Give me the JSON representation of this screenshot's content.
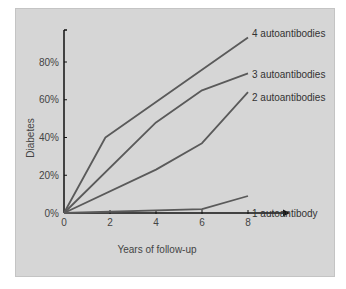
{
  "chart_data": {
    "type": "line",
    "title": "",
    "xlabel": "Years of follow-up",
    "ylabel": "Diabetes",
    "xlim": [
      0,
      8
    ],
    "ylim": [
      0,
      95
    ],
    "x_ticks": [
      "0",
      "2",
      "4",
      "6",
      "8"
    ],
    "y_ticks": [
      "0%",
      "20%",
      "40%",
      "60%",
      "80%"
    ],
    "grid": false,
    "legend_position": "inline-right",
    "series": [
      {
        "name": "4 autoantibodies",
        "points": [
          [
            0,
            0
          ],
          [
            1.8,
            40
          ],
          [
            8,
            93
          ]
        ]
      },
      {
        "name": "3 autoantibodies",
        "points": [
          [
            0,
            0
          ],
          [
            4,
            48
          ],
          [
            6,
            65
          ],
          [
            8,
            74
          ]
        ]
      },
      {
        "name": "2 autoantibodies",
        "points": [
          [
            0,
            0
          ],
          [
            4,
            23
          ],
          [
            6,
            37
          ],
          [
            8,
            64
          ]
        ]
      },
      {
        "name": "1 autoantibody",
        "points": [
          [
            0,
            0
          ],
          [
            6,
            2
          ],
          [
            8,
            9
          ]
        ]
      }
    ]
  },
  "colors": {
    "panel_bg": "#d6d6d6",
    "line": "#5a5a5a",
    "axis": "#111111"
  }
}
